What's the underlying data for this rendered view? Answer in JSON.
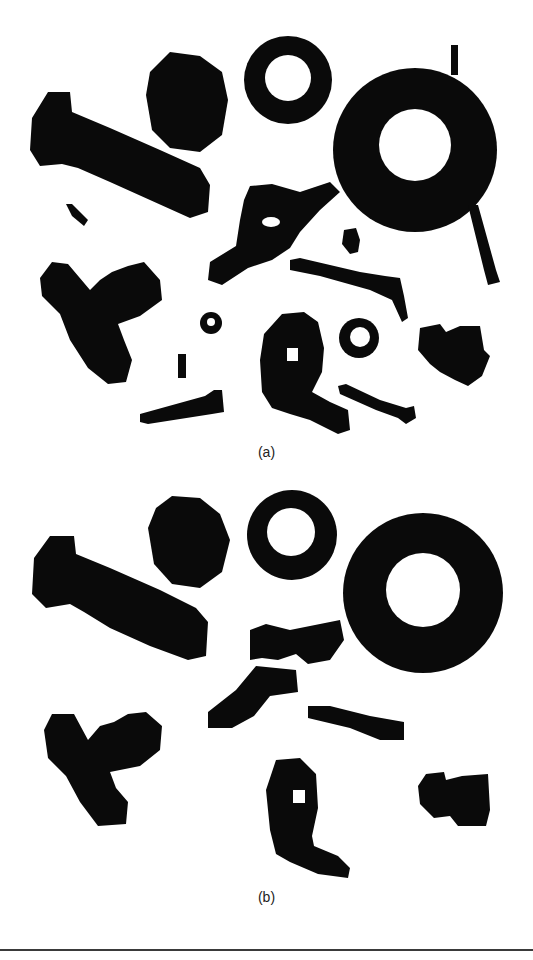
{
  "figure": {
    "panels": [
      {
        "id": "a",
        "label": "(a)",
        "description": "Binary image of hardware objects (bolts, nuts, washers, wing nut, rods) with small noise fragments"
      },
      {
        "id": "b",
        "label": "(b)",
        "description": "Same binary image after processing: thin rods and small fragments removed, remaining objects smoothed"
      }
    ],
    "colors": {
      "foreground": "#0a0a0a",
      "background": "#ffffff",
      "rule": "#3a3a3a"
    }
  }
}
